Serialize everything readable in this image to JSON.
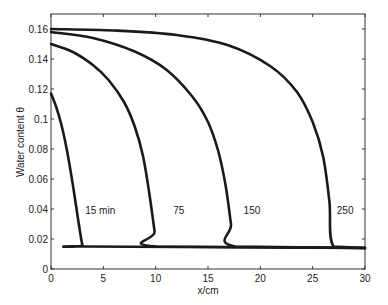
{
  "chart_data": {
    "type": "line",
    "title": "",
    "xlabel": "x/cm",
    "ylabel": "Water content θ",
    "xlim": [
      0,
      30
    ],
    "ylim": [
      0,
      0.17
    ],
    "grid": false,
    "legend": "none (inline curve labels)",
    "x_ticks": [
      0,
      5,
      10,
      15,
      20,
      25,
      30
    ],
    "y_ticks": [
      0,
      0.02,
      0.04,
      0.06,
      0.08,
      0.1,
      0.12,
      0.14,
      0.16
    ],
    "x_tick_labels": [
      "0",
      "5",
      "10",
      "15",
      "20",
      "25",
      "30"
    ],
    "y_tick_labels": [
      "0",
      "0.02",
      "0.04",
      "0.06",
      "0.08",
      "0.1",
      "0.12",
      "0.14",
      "0.16"
    ],
    "series": [
      {
        "name": "15 min",
        "label": "15 min",
        "x": [
          0,
          0.5,
          1.0,
          1.5,
          2.0,
          2.4,
          2.7,
          3.0,
          3.2,
          30
        ],
        "y": [
          0.117,
          0.108,
          0.096,
          0.08,
          0.06,
          0.042,
          0.028,
          0.016,
          0.015,
          0.014
        ]
      },
      {
        "name": "75",
        "label": "75",
        "x": [
          0,
          2,
          4,
          5.5,
          7,
          8,
          8.8,
          9.4,
          9.9,
          10.1,
          30
        ],
        "y": [
          0.15,
          0.145,
          0.136,
          0.126,
          0.111,
          0.095,
          0.075,
          0.05,
          0.025,
          0.015,
          0.014
        ]
      },
      {
        "name": "150",
        "label": "150",
        "x": [
          0,
          4,
          8,
          11,
          13.5,
          15,
          16,
          16.7,
          17.2,
          17.6,
          30
        ],
        "y": [
          0.158,
          0.154,
          0.145,
          0.133,
          0.115,
          0.098,
          0.078,
          0.055,
          0.03,
          0.015,
          0.014
        ]
      },
      {
        "name": "250",
        "label": "250",
        "x": [
          0,
          6,
          12,
          17,
          21,
          23.5,
          25,
          26,
          26.6,
          27.0,
          30
        ],
        "y": [
          0.16,
          0.159,
          0.156,
          0.149,
          0.135,
          0.118,
          0.098,
          0.075,
          0.045,
          0.015,
          0.014
        ]
      }
    ],
    "annotations": [
      {
        "text": "15 min",
        "x": 4.7,
        "y": 0.037
      },
      {
        "text": "75",
        "x": 12.2,
        "y": 0.037
      },
      {
        "text": "150",
        "x": 19.2,
        "y": 0.037
      },
      {
        "text": "250",
        "x": 28.1,
        "y": 0.037
      }
    ]
  }
}
